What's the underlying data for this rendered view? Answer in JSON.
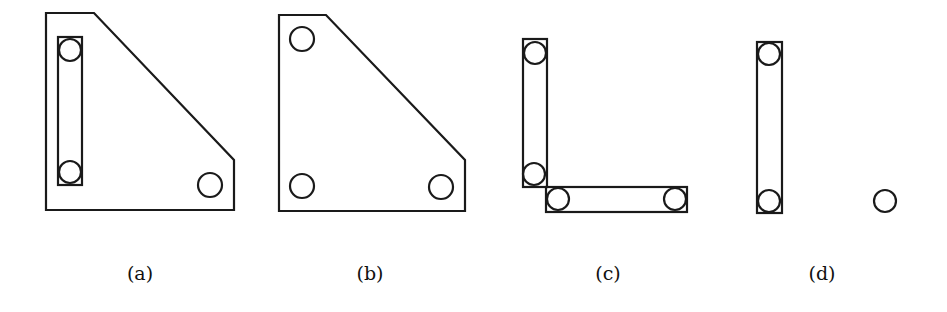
{
  "figure": {
    "panels": [
      {
        "label": "(a)",
        "label_x": 140,
        "description": "Plate with three holes; two left holes joined by a slot link"
      },
      {
        "label": "(b)",
        "label_x": 370,
        "description": "Plate with three independent holes"
      },
      {
        "label": "(c)",
        "label_x": 608,
        "description": "Two links forming an L-shape, each with two holes"
      },
      {
        "label": "(d)",
        "label_x": 822,
        "description": "Single vertical link with two holes and a separate lone hole"
      }
    ],
    "stroke_color": "#1a1a1a",
    "background": "#ffffff"
  }
}
